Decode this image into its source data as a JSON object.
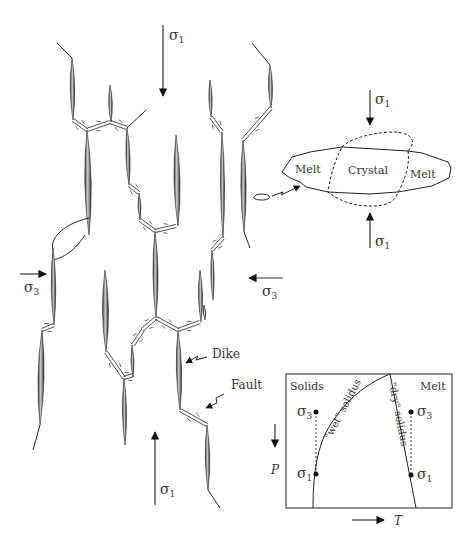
{
  "figure": {
    "main_diagram": {
      "stress_labels": {
        "sigma1_top": {
          "symbol": "σ",
          "subscript": "1"
        },
        "sigma1_bottom": {
          "symbol": "σ",
          "subscript": "1"
        },
        "sigma3_left": {
          "symbol": "σ",
          "subscript": "3"
        },
        "sigma3_right": {
          "symbol": "σ",
          "subscript": "3"
        }
      },
      "annotations": {
        "dike": "Dike",
        "fault": "Fault"
      }
    },
    "grain_inset": {
      "melt_left": "Melt",
      "crystal": "Crystal",
      "melt_right": "Melt",
      "sigma1_top": {
        "symbol": "σ",
        "subscript": "1"
      },
      "sigma1_bottom": {
        "symbol": "σ",
        "subscript": "1"
      }
    },
    "phase_inset": {
      "region_left": "Solids",
      "region_right": "Melt",
      "curve_wet": "\"wet\" solidus",
      "curve_dry": "\"dry\" solidus",
      "points_left": [
        {
          "symbol": "σ",
          "subscript": "3"
        },
        {
          "symbol": "σ",
          "subscript": "1"
        }
      ],
      "points_right": [
        {
          "symbol": "σ",
          "subscript": "3"
        },
        {
          "symbol": "σ",
          "subscript": "1"
        }
      ],
      "axis_y": "P",
      "axis_x": "T"
    }
  }
}
